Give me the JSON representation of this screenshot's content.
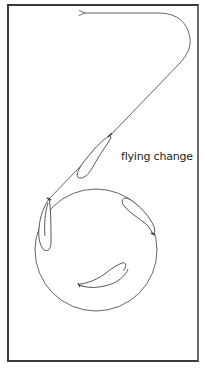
{
  "diagram": {
    "title": "",
    "labels": {
      "flying_change": "flying change"
    },
    "elements": [
      {
        "type": "circle",
        "name": "riding-circle"
      },
      {
        "type": "path",
        "name": "exit-path",
        "direction": "arrow pointing left at top"
      },
      {
        "type": "horse",
        "name": "horse-on-diagonal",
        "note": "flying change point"
      },
      {
        "type": "horse",
        "name": "horse-left-of-circle"
      },
      {
        "type": "horse",
        "name": "horse-right-of-circle"
      },
      {
        "type": "horse",
        "name": "horse-bottom-of-circle"
      }
    ],
    "colors": {
      "line": "#555555",
      "frame": "#3a3a3a",
      "background": "#ffffff"
    }
  }
}
